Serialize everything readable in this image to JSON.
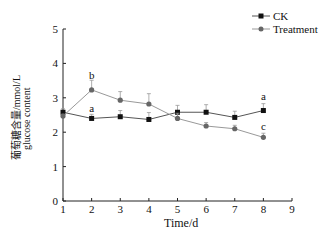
{
  "chart_data": {
    "type": "line",
    "title": "",
    "xlabel": "Time/d",
    "ylabel_cn": "葡萄糖含量/mmol/L",
    "ylabel_en": "glucose content",
    "x": [
      1,
      2,
      3,
      4,
      5,
      6,
      7,
      8
    ],
    "xticks": [
      "1",
      "2",
      "3",
      "4",
      "5",
      "6",
      "7",
      "8",
      "9"
    ],
    "yticks": [
      "0",
      "1",
      "2",
      "3",
      "4",
      "5"
    ],
    "xlim": [
      1,
      9
    ],
    "ylim": [
      0,
      5
    ],
    "grid": false,
    "legend_position": "top-right",
    "series": [
      {
        "name": "CK",
        "marker": "square",
        "color": "#111111",
        "line_color": "#555555",
        "values": [
          2.58,
          2.4,
          2.45,
          2.37,
          2.58,
          2.58,
          2.43,
          2.63
        ],
        "errors": [
          0.1,
          0.12,
          0.18,
          0.2,
          0.2,
          0.22,
          0.18,
          0.2
        ]
      },
      {
        "name": "Treatment",
        "marker": "circle",
        "color": "#666666",
        "line_color": "#999999",
        "values": [
          2.47,
          3.23,
          2.93,
          2.82,
          2.4,
          2.18,
          2.1,
          1.85
        ],
        "errors": [
          0.05,
          0.28,
          0.25,
          0.3,
          0.15,
          0.1,
          0.1,
          0.12
        ]
      }
    ],
    "annotations": [
      {
        "text": "b",
        "x": 2,
        "y": 3.55
      },
      {
        "text": "a",
        "x": 2,
        "y": 2.6
      },
      {
        "text": "a",
        "x": 8,
        "y": 2.95
      },
      {
        "text": "c",
        "x": 8,
        "y": 2.05
      }
    ]
  }
}
